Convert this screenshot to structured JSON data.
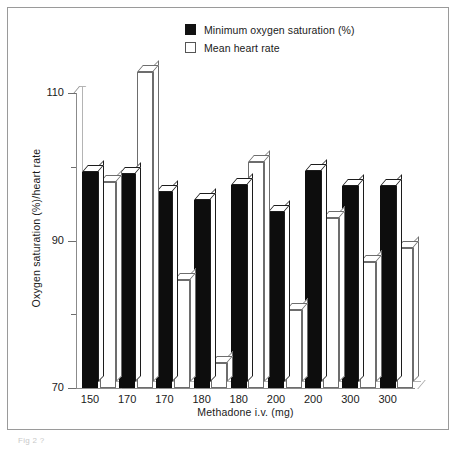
{
  "figure": {
    "caption": "Fig 2 ?"
  },
  "legend": {
    "position": "top-center",
    "entries": [
      {
        "label": "Minimum oxygen saturation (%)",
        "swatch": "filled-square-icon",
        "color": "#0d0d0d"
      },
      {
        "label": "Mean heart rate",
        "swatch": "hollow-square-icon",
        "color": "#ffffff"
      }
    ]
  },
  "chart_data": {
    "type": "bar",
    "title": "",
    "subtitle": "",
    "xlabel": "Methadone i.v. (mg)",
    "ylabel": "Oxygen saturation (%)/heart rate",
    "categories": [
      "150",
      "170",
      "170",
      "180",
      "180",
      "200",
      "200",
      "300",
      "300"
    ],
    "series": [
      {
        "name": "Minimum oxygen saturation (%)",
        "color": "#0d0d0d",
        "values": [
          99.3,
          99.0,
          96.6,
          95.5,
          97.5,
          93.9,
          99.4,
          97.4,
          97.4
        ]
      },
      {
        "name": "Mean heart rate",
        "color": "#ffffff",
        "values": [
          97.9,
          112.8,
          84.6,
          73.4,
          100.6,
          80.6,
          93.0,
          87.1,
          89.0
        ]
      }
    ],
    "ylim": [
      70,
      114
    ],
    "yticks": [
      70,
      90,
      110
    ],
    "ytick_labels": [
      "70",
      "90",
      "110"
    ],
    "yminor_ticks": [
      80,
      100
    ],
    "grid": false,
    "style": "3d-bars"
  }
}
